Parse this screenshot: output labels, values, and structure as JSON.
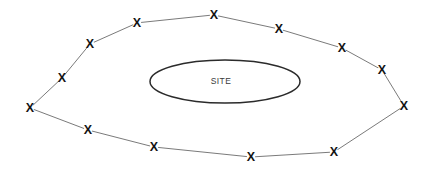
{
  "figure": {
    "background_color": "#ffffff",
    "width": 428,
    "height": 173
  },
  "site": {
    "label": "SITE",
    "shape": "ellipse",
    "center_x": 225,
    "center_y": 81.5,
    "radius_x": 75,
    "radius_y": 21.5,
    "stroke_color": "#2b2b2b",
    "label_x": 221,
    "label_y": 81
  },
  "perimeter": {
    "marker_glyph": "X",
    "marker_name": "monitoring-point-marker",
    "marker_color": "#141414",
    "line_color": "#6b6b6b",
    "closed": true,
    "point_count": 15,
    "points": [
      {
        "id": "p1",
        "x": 214,
        "y": 15,
        "position": "top-center"
      },
      {
        "id": "p2",
        "x": 279,
        "y": 29,
        "position": "top-right"
      },
      {
        "id": "p3",
        "x": 342,
        "y": 48,
        "position": "upper-right"
      },
      {
        "id": "p4",
        "x": 382,
        "y": 70,
        "position": "right-upper"
      },
      {
        "id": "p5",
        "x": 404,
        "y": 106,
        "position": "right-vertex"
      },
      {
        "id": "p6",
        "x": 334,
        "y": 152,
        "position": "lower-right"
      },
      {
        "id": "p7",
        "x": 251,
        "y": 157,
        "position": "bottom-center"
      },
      {
        "id": "p8",
        "x": 154,
        "y": 147,
        "position": "bottom-left"
      },
      {
        "id": "p9",
        "x": 88,
        "y": 130,
        "position": "lower-left"
      },
      {
        "id": "p10",
        "x": 30,
        "y": 108,
        "position": "left-vertex"
      },
      {
        "id": "p11",
        "x": 62,
        "y": 78,
        "position": "left-upper"
      },
      {
        "id": "p12",
        "x": 90,
        "y": 44,
        "position": "upper-left"
      },
      {
        "id": "p13",
        "x": 137,
        "y": 23,
        "position": "top-left"
      }
    ]
  }
}
